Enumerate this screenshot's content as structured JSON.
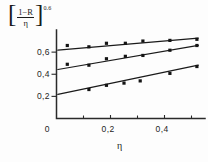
{
  "chart_data": {
    "type": "scatter",
    "title": "",
    "subtitle": "",
    "ylabel": "[(1-R)/η]^0.6",
    "ylabel_parts": {
      "bracket_open": "[",
      "numerator": "1−R",
      "denominator": "η",
      "bracket_close": "]",
      "exponent": "0.6"
    },
    "xlabel": "η",
    "xlim": [
      0.0,
      0.55
    ],
    "ylim": [
      0.0,
      0.8
    ],
    "xticks": [
      0.2,
      0.4
    ],
    "xtick_labels": [
      "0,2",
      "0,4"
    ],
    "yticks": [
      0.2,
      0.4,
      0.6
    ],
    "ytick_labels": [
      "0,2",
      "0,4",
      "0,6"
    ],
    "origin_label": "0",
    "grid": false,
    "legend": "none",
    "series": [
      {
        "name": "upper",
        "marker": "filled-square",
        "fit_line": {
          "x0": 0.005,
          "y0": 0.617,
          "x1": 0.525,
          "y1": 0.727
        },
        "x": [
          0.04,
          0.12,
          0.185,
          0.255,
          0.32,
          0.42,
          0.52
        ],
        "y": [
          0.66,
          0.648,
          0.68,
          0.68,
          0.7,
          0.706,
          0.716
        ]
      },
      {
        "name": "middle",
        "marker": "filled-square",
        "fit_line": {
          "x0": 0.005,
          "y0": 0.443,
          "x1": 0.525,
          "y1": 0.66
        },
        "x": [
          0.04,
          0.12,
          0.185,
          0.255,
          0.32,
          0.42,
          0.52
        ],
        "y": [
          0.49,
          0.482,
          0.54,
          0.562,
          0.57,
          0.617,
          0.66
        ]
      },
      {
        "name": "lower",
        "marker": "filled-square",
        "fit_line": {
          "x0": 0.005,
          "y0": 0.218,
          "x1": 0.525,
          "y1": 0.482
        },
        "x": [
          0.12,
          0.185,
          0.25,
          0.31,
          0.42,
          0.52
        ],
        "y": [
          0.262,
          0.3,
          0.32,
          0.34,
          0.408,
          0.47
        ]
      }
    ]
  }
}
